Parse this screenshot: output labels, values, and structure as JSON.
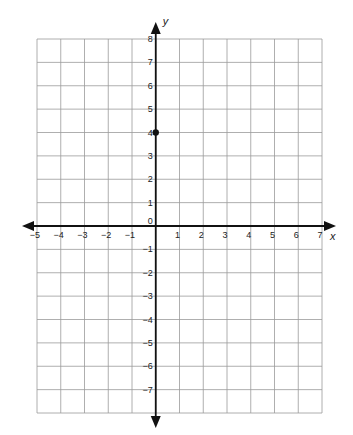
{
  "chart_data": {
    "type": "scatter",
    "title": "",
    "xlabel": "x",
    "ylabel": "y",
    "xlim": [
      -5,
      7
    ],
    "ylim": [
      -8,
      8
    ],
    "grid": true,
    "x_ticks": [
      -5,
      -4,
      -3,
      -2,
      -1,
      1,
      2,
      3,
      4,
      5,
      6,
      7
    ],
    "y_ticks": [
      -7,
      -6,
      -5,
      -4,
      -3,
      -2,
      -1,
      1,
      2,
      3,
      4,
      5,
      6,
      7,
      8
    ],
    "origin_label": "0",
    "tick_labels": {
      "x": [
        "−5",
        "−4",
        "−3",
        "−2",
        "−1",
        "1",
        "2",
        "3",
        "4",
        "5",
        "6",
        "7"
      ],
      "y": [
        "−7",
        "−6",
        "−5",
        "−4",
        "−3",
        "−2",
        "−1",
        "1",
        "2",
        "3",
        "4",
        "5",
        "6",
        "7",
        "8"
      ]
    },
    "series": [
      {
        "name": "point",
        "points": [
          {
            "x": 0,
            "y": 4
          }
        ]
      }
    ]
  },
  "style": {
    "grid_color": "#9a9a9a",
    "axis_color": "#111111",
    "point_color": "#111111"
  },
  "layout": {
    "grid_left": 37,
    "grid_right": 322,
    "grid_top": 39,
    "grid_bottom": 413,
    "x_arrow_left": 22,
    "x_arrow_right": 336,
    "y_arrow_top": 22,
    "y_arrow_bottom": 428
  }
}
